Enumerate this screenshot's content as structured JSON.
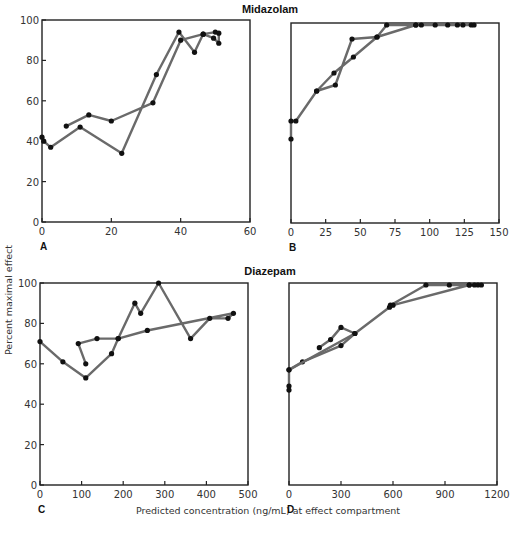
{
  "figure": {
    "y_axis_label": "Percent maximal effect",
    "x_axis_label": "Predicted concentration (ng/mL) at effect compartment",
    "group_titles": [
      "Midazolam",
      "Diazepam"
    ]
  },
  "chart_data": [
    {
      "panel": "A",
      "group": "Midazolam",
      "type": "line",
      "xlim": [
        0,
        60
      ],
      "ylim": [
        0,
        100
      ],
      "xticks": [
        0,
        20,
        40,
        60
      ],
      "yticks": [
        0,
        20,
        40,
        60,
        80,
        100
      ],
      "grid": false,
      "ylabel": "Percent maximal effect",
      "frame": {
        "x0": 42,
        "x1": 250,
        "y0": 222,
        "y1": 20
      },
      "series": [
        {
          "name": "hysteresis-loop",
          "points": [
            [
              0,
              42
            ],
            [
              0.5,
              40
            ],
            [
              2.5,
              37
            ],
            [
              11,
              47
            ],
            [
              23,
              34
            ],
            [
              33,
              73
            ],
            [
              39.5,
              94
            ],
            [
              44,
              84
            ],
            [
              46.5,
              93
            ],
            [
              50,
              94
            ],
            [
              51,
              93.5
            ],
            [
              51,
              88.5
            ],
            [
              49.5,
              91
            ],
            [
              46.5,
              93
            ],
            [
              40,
              90
            ],
            [
              32,
              59
            ],
            [
              20,
              50
            ],
            [
              13.5,
              53
            ],
            [
              7,
              47.5
            ]
          ]
        }
      ]
    },
    {
      "panel": "B",
      "group": "Midazolam",
      "type": "line",
      "xlim": [
        0,
        150
      ],
      "ylim": [
        0,
        100
      ],
      "xticks": [
        0,
        25,
        50,
        75,
        100,
        125,
        150
      ],
      "yticks": [],
      "grid": false,
      "frame": {
        "x0": 291,
        "x1": 499,
        "y0": 223,
        "y1": 23
      },
      "series": [
        {
          "name": "collapsed-curve",
          "points": [
            [
              0,
              42
            ],
            [
              0,
              51
            ],
            [
              3.5,
              51
            ],
            [
              18.5,
              66
            ],
            [
              32,
              69
            ],
            [
              44,
              92
            ],
            [
              62,
              93
            ],
            [
              69,
              99
            ],
            [
              90,
              99
            ],
            [
              94,
              99
            ],
            [
              104,
              99
            ],
            [
              113,
              99
            ],
            [
              120,
              99
            ],
            [
              124,
              99
            ],
            [
              130,
              99
            ],
            [
              132,
              99
            ],
            [
              90,
              99
            ],
            [
              62,
              93
            ],
            [
              45,
              83
            ],
            [
              31,
              75
            ],
            [
              18.5,
              66
            ]
          ]
        }
      ]
    },
    {
      "panel": "C",
      "group": "Diazepam",
      "type": "line",
      "xlim": [
        0,
        500
      ],
      "ylim": [
        0,
        100
      ],
      "xticks": [
        0,
        100,
        200,
        300,
        400,
        500
      ],
      "yticks": [
        0,
        20,
        40,
        60,
        80,
        100
      ],
      "grid": false,
      "xlabel": "Predicted concentration (ng/mL) at effect compartment",
      "ylabel": "Percent maximal effect",
      "frame": {
        "x0": 40,
        "x1": 248,
        "y0": 485,
        "y1": 283
      },
      "series": [
        {
          "name": "hysteresis-loop",
          "points": [
            [
              0,
              71
            ],
            [
              55,
              61
            ],
            [
              110,
              53
            ],
            [
              172,
              65
            ],
            [
              188,
              72.5
            ],
            [
              228,
              90
            ],
            [
              242,
              85
            ],
            [
              285,
              100
            ],
            [
              362,
              72.5
            ],
            [
              408,
              82.5
            ],
            [
              452,
              82.5
            ],
            [
              465,
              85
            ],
            [
              258,
              76.5
            ],
            [
              188,
              72.5
            ],
            [
              137,
              72.5
            ],
            [
              92,
              70
            ],
            [
              110,
              60
            ]
          ]
        }
      ]
    },
    {
      "panel": "D",
      "group": "Diazepam",
      "type": "line",
      "xlim": [
        0,
        1200
      ],
      "ylim": [
        0,
        100
      ],
      "xticks": [
        0,
        300,
        600,
        900,
        1200
      ],
      "yticks": [],
      "grid": false,
      "frame": {
        "x0": 289,
        "x1": 497,
        "y0": 485,
        "y1": 283
      },
      "series": [
        {
          "name": "collapsed-curve",
          "points": [
            [
              0,
              47
            ],
            [
              0,
              49
            ],
            [
              0,
              57
            ],
            [
              78,
              61
            ],
            [
              300,
              69
            ],
            [
              380,
              75
            ],
            [
              300,
              78
            ],
            [
              240,
              72
            ],
            [
              175,
              68
            ]
          ]
        },
        {
          "name": "collapsed-curve-upper",
          "points": [
            [
              0,
              57
            ],
            [
              380,
              75
            ],
            [
              580,
              88
            ],
            [
              585,
              89
            ],
            [
              790,
              99
            ],
            [
              925,
              99
            ],
            [
              1040,
              99
            ],
            [
              1070,
              99
            ],
            [
              1090,
              99
            ],
            [
              1110,
              99
            ],
            [
              1040,
              99
            ],
            [
              600,
              89
            ]
          ]
        }
      ]
    }
  ]
}
